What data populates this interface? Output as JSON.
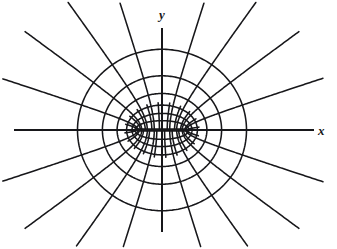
{
  "figure": {
    "title": "",
    "background_color": "#ffffff",
    "stroke_color": "#17171a",
    "width": 337,
    "height": 249
  },
  "axes": {
    "x_label": "x",
    "y_label": "y",
    "origin": {
      "x": 162,
      "y": 130
    },
    "x_axis_extent": [
      14,
      314
    ],
    "y_axis_extent": [
      28,
      232
    ]
  },
  "chart_data": {
    "type": "line",
    "xlabel": "x",
    "ylabel": "y",
    "grid": false,
    "legend": "none",
    "coordinate_system": "elliptic",
    "focal_distance_px": 25,
    "foci": [
      {
        "x": -25,
        "y": 0
      },
      {
        "x": 25,
        "y": 0
      }
    ],
    "center_px": {
      "x": 162,
      "y": 130
    },
    "scale_y_over_x": 1.0,
    "xlim": [
      -148,
      152
    ],
    "ylim": [
      -102,
      102
    ],
    "series": [
      {
        "name": "confocal-ellipses",
        "kind": "ellipse",
        "note": "u = const; semi-axes a = c*cosh(u), b = c*sinh(u)",
        "u_values": [
          0.38,
          0.62,
          0.88,
          1.18,
          1.52,
          1.9
        ],
        "semi_axes_px": [
          {
            "a": 26.9,
            "b": 9.3
          },
          {
            "a": 30.0,
            "b": 16.6
          },
          {
            "a": 35.4,
            "b": 24.9
          },
          {
            "a": 44.9,
            "b": 36.5
          },
          {
            "a": 59.6,
            "b": 54.2
          },
          {
            "a": 84.5,
            "b": 80.7
          }
        ]
      },
      {
        "name": "confocal-hyperbolas",
        "kind": "hyperbola",
        "note": "v = const; a = c*|cos v|, b = c*|sin v|",
        "v_values_deg": [
          0,
          18,
          36,
          54,
          72,
          90,
          108,
          126,
          144,
          162,
          180
        ],
        "branch_count": 20
      }
    ],
    "annotations": [
      {
        "text": "x",
        "position": "right of x-axis",
        "style": "italic"
      },
      {
        "text": "y",
        "position": "above y-axis",
        "style": "italic"
      }
    ]
  }
}
